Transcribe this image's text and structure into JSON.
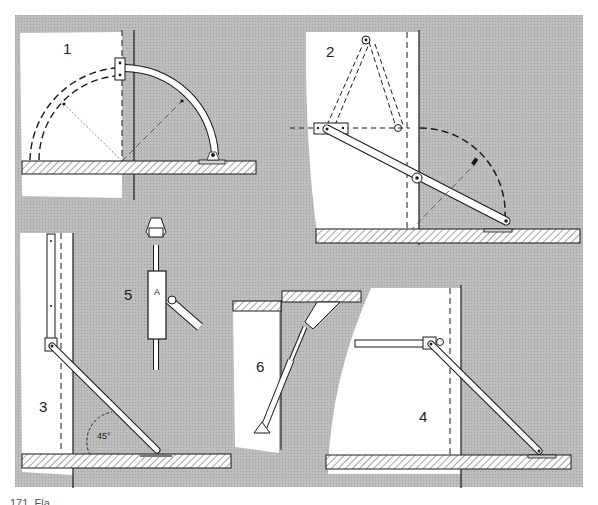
{
  "figure": {
    "background_color": "#b9b9b9",
    "paper_color": "#ffffff",
    "line_color": "#1a1a1a",
    "panels": [
      {
        "id": "1",
        "label": "1",
        "description": "curved quadrant stay, lid shown closed (dashed) and open"
      },
      {
        "id": "2",
        "label": "2",
        "description": "folding two-piece stay with pivot, dashed folded position and arc"
      },
      {
        "id": "3",
        "label": "3",
        "description": "sliding stay on vertical track",
        "angle_label": "45°"
      },
      {
        "id": "4",
        "label": "4",
        "description": "horizontal sliding rail stay to flap"
      },
      {
        "id": "5",
        "label": "5",
        "description": "detail of sliding block with stay arm",
        "part_label": "A"
      },
      {
        "id": "6",
        "label": "6",
        "description": "gas strut / telescopic stay under overhead flap"
      }
    ]
  },
  "caption": {
    "text": "171. Fla"
  }
}
